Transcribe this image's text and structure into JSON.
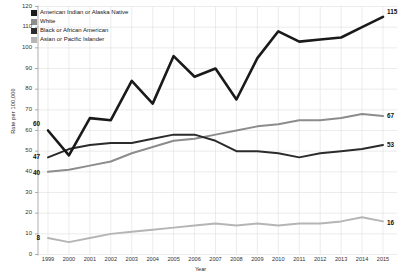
{
  "chart_data": {
    "type": "line",
    "title": "",
    "xlabel": "Year",
    "ylabel": "Rate per 100,000",
    "x": [
      1999,
      2000,
      2001,
      2002,
      2003,
      2004,
      2005,
      2006,
      2007,
      2008,
      2009,
      2010,
      2011,
      2012,
      2013,
      2014,
      2015
    ],
    "xlim": [
      1999,
      2015
    ],
    "ylim": [
      0,
      120
    ],
    "yticks": [
      0,
      10,
      20,
      30,
      40,
      50,
      60,
      70,
      80,
      90,
      100,
      110,
      120
    ],
    "grid": true,
    "legend_position": "top-left",
    "series": [
      {
        "name": "American Indian or Alaska Native",
        "color": "#1a1a1a",
        "values": [
          60,
          48,
          66,
          65,
          84,
          73,
          96,
          86,
          90,
          75,
          95,
          108,
          103,
          104,
          105,
          110,
          115
        ],
        "start_label": "60",
        "end_label": "115"
      },
      {
        "name": "White",
        "color": "#8c8c8c",
        "values": [
          40,
          41,
          43,
          45,
          49,
          52,
          55,
          56,
          58,
          60,
          62,
          63,
          65,
          65,
          66,
          68,
          67
        ],
        "start_label": "40",
        "end_label": "67"
      },
      {
        "name": "Black or African American",
        "color": "#2b2b2b",
        "values": [
          47,
          51,
          53,
          54,
          54,
          56,
          58,
          58,
          55,
          50,
          50,
          49,
          47,
          49,
          50,
          51,
          53
        ],
        "start_label": "47",
        "end_label": "53"
      },
      {
        "name": "Asian or Pacific Islander",
        "color": "#b5b5b5",
        "values": [
          8,
          6,
          8,
          10,
          11,
          12,
          13,
          14,
          15,
          14,
          15,
          14,
          15,
          15,
          16,
          18,
          16
        ],
        "start_label": "8",
        "end_label": "16"
      }
    ]
  },
  "legend": {
    "items": [
      {
        "label": "American Indian or Alaska Native",
        "color": "#1a1a1a"
      },
      {
        "label": "White",
        "color": "#8c8c8c"
      },
      {
        "label": "Black or African American",
        "color": "#2b2b2b"
      },
      {
        "label": "Asian or Pacific Islander",
        "color": "#b5b5b5"
      }
    ]
  },
  "axes": {
    "y_title": "Rate per 100,000",
    "x_title": "Year",
    "y_ticks": [
      "0",
      "10",
      "20",
      "30",
      "40",
      "50",
      "60",
      "70",
      "80",
      "90",
      "100",
      "110",
      "120"
    ],
    "x_ticks": [
      "1999",
      "2000",
      "2001",
      "2002",
      "2003",
      "2004",
      "2005",
      "2006",
      "2007",
      "2008",
      "2009",
      "2010",
      "2011",
      "2012",
      "2013",
      "2014",
      "2015"
    ]
  }
}
